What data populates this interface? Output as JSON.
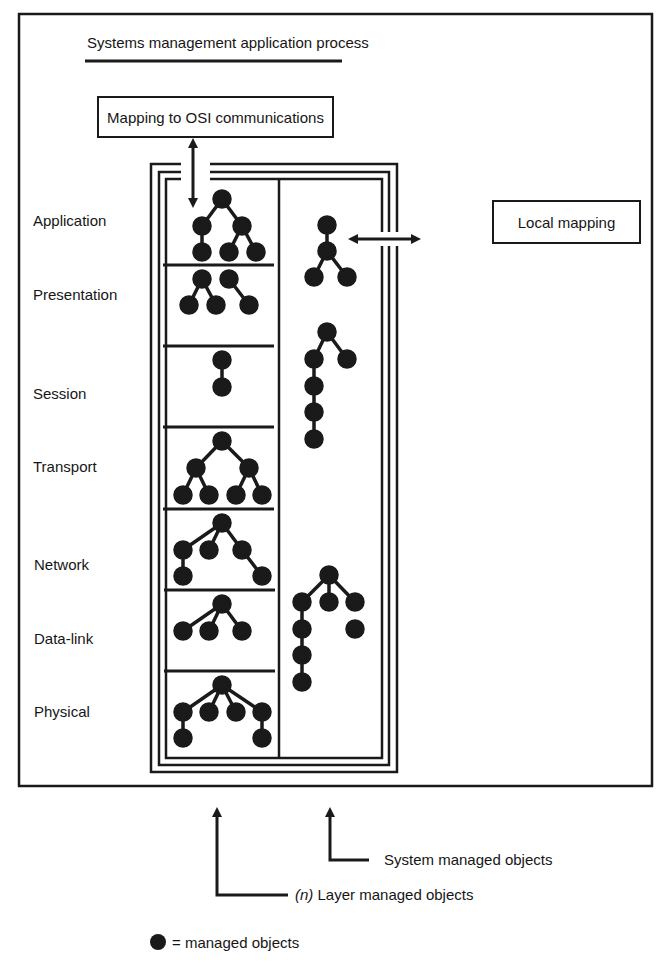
{
  "diagram": {
    "title": "Systems management application process",
    "top_box": "Mapping to OSI communications",
    "side_box": "Local mapping",
    "layers": [
      {
        "name": "Application",
        "y": 220
      },
      {
        "name": "Presentation",
        "y": 294
      },
      {
        "name": "Session",
        "y": 394
      },
      {
        "name": "Transport",
        "y": 466
      },
      {
        "name": "Network",
        "y": 565
      },
      {
        "name": "Data-link",
        "y": 639
      },
      {
        "name": "Physical",
        "y": 712
      }
    ],
    "callouts": {
      "system_managed": "System managed objects",
      "layer_managed_prefix": "(n)",
      "layer_managed": "Layer managed objects"
    },
    "legend": {
      "symbol": "filled-circle",
      "text": "= managed objects"
    },
    "colors": {
      "ink": "#1a1a1a",
      "background": "#ffffff"
    }
  }
}
